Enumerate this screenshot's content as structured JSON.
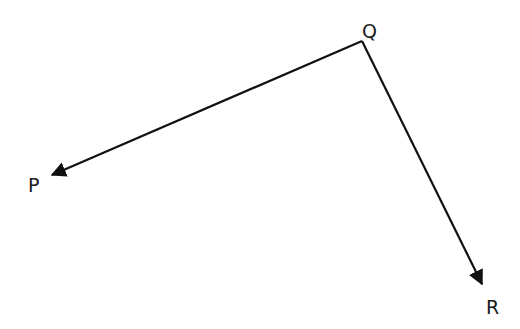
{
  "diagram": {
    "type": "angle-vectors",
    "vertex": {
      "label": "Q",
      "x": 362,
      "y": 41,
      "label_x": 362,
      "label_y": 38
    },
    "rays": [
      {
        "to": "P",
        "x2": 48,
        "y2": 177,
        "label": "P",
        "label_x": 28,
        "label_y": 192
      },
      {
        "to": "R",
        "x2": 484,
        "y2": 288,
        "label": "R",
        "label_x": 486,
        "label_y": 314
      }
    ],
    "stroke_color": "#111111"
  }
}
